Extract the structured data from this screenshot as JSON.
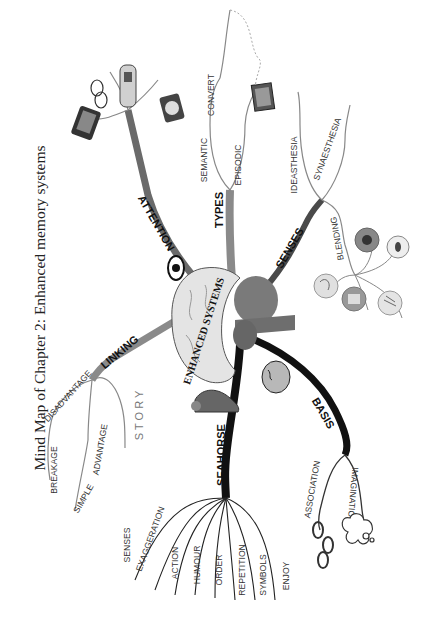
{
  "title": "Mind Map of Chapter 2: Enhanced memory systems",
  "center": {
    "label": "ENHANCED SYSTEMS",
    "icon": "brain-icon"
  },
  "colors": {
    "dark_branch": "#111111",
    "mid_branch": "#555555",
    "light_branch": "#8a8a8a",
    "brain_fill": "#e4e4e4",
    "brain_core": "#7a7a7a"
  },
  "branches": [
    {
      "id": "attention",
      "label": "ATTENTION",
      "icon": "eye-icon",
      "images": [
        "tablet-icon",
        "glasses-icon",
        "car-icon"
      ]
    },
    {
      "id": "types",
      "label": "TYPES",
      "children": [
        {
          "label": "SEMANTIC",
          "children": [
            {
              "label": "CONVERT"
            }
          ]
        },
        {
          "label": "EPISODIC"
        }
      ],
      "images": [
        "clock-icon",
        "photo-icon"
      ]
    },
    {
      "id": "senses",
      "label": "SENSES",
      "children": [
        {
          "label": "IDEASTHESIA"
        },
        {
          "label": "SYNAESTHESIA"
        },
        {
          "label": "BLENDING"
        }
      ],
      "images": [
        "mouth-icon",
        "eye-icon",
        "ear-icon",
        "nose-icon",
        "hand-icon"
      ]
    },
    {
      "id": "basis",
      "label": "BASIS",
      "icon": "head-icon",
      "children": [
        {
          "label": "ASSOCIATION",
          "image": "chain-icon"
        },
        {
          "label": "IMAGINATION",
          "image": "thought-cloud-icon"
        }
      ]
    },
    {
      "id": "seahorse",
      "label": "SEAHORSE",
      "icon": "seahorse-icon",
      "children": [
        {
          "label": "SENSES"
        },
        {
          "label": "EXAGGERATION"
        },
        {
          "label": "ACTION"
        },
        {
          "label": "HUMOUR"
        },
        {
          "label": "ORDER"
        },
        {
          "label": "REPETITION"
        },
        {
          "label": "SYMBOLS"
        },
        {
          "label": "ENJOY"
        }
      ]
    },
    {
      "id": "linking",
      "label": "LINKING",
      "children": [
        {
          "label": "DISADVANTAGE",
          "children": [
            {
              "label": "BREAKAGE"
            }
          ]
        },
        {
          "label": "ADVANTAGE",
          "children": [
            {
              "label": "SIMPLE"
            }
          ]
        },
        {
          "label": "STORY"
        }
      ]
    }
  ]
}
